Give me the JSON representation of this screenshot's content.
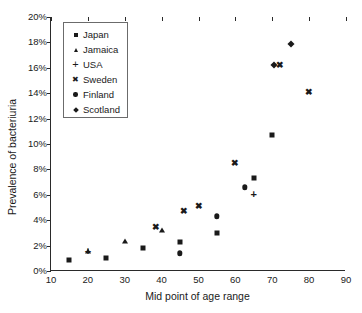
{
  "chart_data": {
    "type": "scatter",
    "title": "",
    "xlabel": "Mid point of age range",
    "ylabel": "Prevalence of bacteriuria",
    "xlim": [
      10,
      90
    ],
    "ylim": [
      0,
      20
    ],
    "xticks": [
      "10",
      "20",
      "30",
      "40",
      "50",
      "60",
      "70",
      "80",
      "90"
    ],
    "yticks": [
      "0%",
      "2%",
      "4%",
      "6%",
      "8%",
      "10%",
      "12%",
      "14%",
      "16%",
      "18%",
      "20%"
    ],
    "grid": false,
    "legend_position": "top-left-inside",
    "series": [
      {
        "name": "Japan",
        "marker": "square",
        "points": [
          {
            "x": 15,
            "y": 0.85
          },
          {
            "x": 25,
            "y": 1.0
          },
          {
            "x": 35,
            "y": 1.8
          },
          {
            "x": 45,
            "y": 2.3
          },
          {
            "x": 55,
            "y": 3.0
          },
          {
            "x": 65,
            "y": 7.3
          },
          {
            "x": 70,
            "y": 10.7
          }
        ]
      },
      {
        "name": "Jamaica",
        "marker": "triangle",
        "points": [
          {
            "x": 20,
            "y": 1.6
          },
          {
            "x": 30,
            "y": 2.4
          },
          {
            "x": 40,
            "y": 3.25
          }
        ]
      },
      {
        "name": "USA",
        "marker": "plus",
        "points": [
          {
            "x": 20,
            "y": 1.6
          },
          {
            "x": 65,
            "y": 6.1
          }
        ]
      },
      {
        "name": "Sweden",
        "marker": "cross",
        "points": [
          {
            "x": 38.5,
            "y": 3.5
          },
          {
            "x": 46,
            "y": 4.7
          },
          {
            "x": 50,
            "y": 5.1
          },
          {
            "x": 60,
            "y": 8.5
          },
          {
            "x": 72,
            "y": 16.2
          },
          {
            "x": 80,
            "y": 14.1
          }
        ]
      },
      {
        "name": "Finland",
        "marker": "circle",
        "points": [
          {
            "x": 45,
            "y": 1.4
          },
          {
            "x": 55,
            "y": 4.3
          },
          {
            "x": 62.5,
            "y": 6.6
          }
        ]
      },
      {
        "name": "Scotland",
        "marker": "diamond",
        "points": [
          {
            "x": 70.5,
            "y": 16.2
          },
          {
            "x": 75,
            "y": 17.9
          }
        ]
      }
    ]
  },
  "legend": {
    "items": [
      {
        "label": "Japan",
        "marker": "square"
      },
      {
        "label": "Jamaica",
        "marker": "triangle"
      },
      {
        "label": "USA",
        "marker": "plus"
      },
      {
        "label": "Sweden",
        "marker": "cross"
      },
      {
        "label": "Finland",
        "marker": "circle"
      },
      {
        "label": "Scotland",
        "marker": "diamond"
      }
    ]
  }
}
